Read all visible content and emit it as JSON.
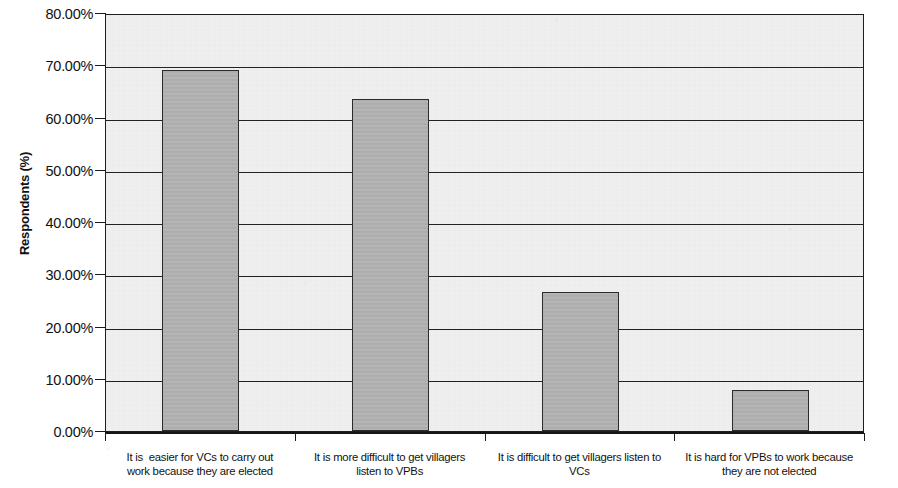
{
  "chart_data": {
    "type": "bar",
    "title": "",
    "xlabel": "",
    "ylabel": "Respondents (%)",
    "ylim": [
      0,
      80
    ],
    "grid": true,
    "legend": "none",
    "y_tick_labels": [
      "0.00%",
      "10.00%",
      "20.00%",
      "30.00%",
      "40.00%",
      "50.00%",
      "60.00%",
      "70.00%",
      "80.00%"
    ],
    "y_tick_values": [
      0,
      10,
      20,
      30,
      40,
      50,
      60,
      70,
      80
    ],
    "categories": [
      "It is  easier for VCs to carry out work because they are elected",
      "It is more difficult to get villagers listen to VPBs",
      "It is difficult to get villagers listen to VCs",
      "It is hard for VPBs to work because they are not elected"
    ],
    "category_lines": [
      [
        "It is  easier for VCs to carry out",
        "work because they are elected"
      ],
      [
        "It is more difficult to get villagers",
        "listen to VPBs"
      ],
      [
        "It is difficult to get villagers listen to",
        "VCs"
      ],
      [
        "It is hard for VPBs to work because",
        "they are not elected"
      ]
    ],
    "values": [
      69.0,
      63.5,
      26.6,
      7.8
    ],
    "value_labels": [
      "69.00%",
      "63.50%",
      "26.60%",
      "7.80%"
    ],
    "colors": {
      "bar_fill": "#b2b2b2",
      "bar_border": "#2b2b2b",
      "plot_background": "#f1f1f1",
      "axis": "#1a1a1a",
      "gridline": "#222222",
      "text": "#111111"
    }
  }
}
